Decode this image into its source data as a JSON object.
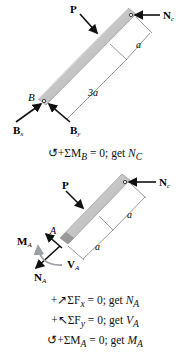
{
  "figure1": {
    "labels": {
      "P": "P",
      "Nc": "N",
      "Nc_sub": "c",
      "B": "B",
      "Bx": "B",
      "Bx_sub": "x",
      "By": "B",
      "By_sub": "y",
      "dim_a": "a",
      "dim_3a": "3a"
    },
    "equation": {
      "prefix": "↺+ΣM",
      "sub": "B",
      "middle": " = 0; get ",
      "var": "N",
      "var_sub": "C"
    }
  },
  "figure2": {
    "labels": {
      "P": "P",
      "Nc": "N",
      "Nc_sub": "c",
      "A": "A",
      "MA": "M",
      "MA_sub": "A",
      "VA": "V",
      "VA_sub": "A",
      "NA": "N",
      "NA_sub": "A",
      "dim_a1": "a",
      "dim_a2": "a"
    },
    "equations": [
      {
        "prefix": "+↗ΣF",
        "sub": "x",
        "middle": " = 0; get ",
        "var": "N",
        "var_sub": "A"
      },
      {
        "prefix": "+↖ΣF",
        "sub": "y",
        "middle": " = 0; get ",
        "var": "V",
        "var_sub": "A"
      },
      {
        "prefix": "↺+ΣM",
        "sub": "A",
        "middle": " = 0; get ",
        "var": "M",
        "var_sub": "A"
      }
    ]
  },
  "colors": {
    "member_fill": "#c8c8c8",
    "member_shade": "#9a9a9a",
    "arrow": "#111111",
    "moment_arrow": "#9aa0a6",
    "dim_line": "#333333"
  }
}
